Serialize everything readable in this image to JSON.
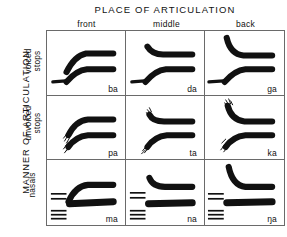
{
  "figure": {
    "type": "schematic-spectrogram-matrix",
    "column_axis_title": "PLACE OF ARTICULATION",
    "row_axis_title": "MANNER OF ARTICULATION",
    "columns": [
      {
        "label": "front"
      },
      {
        "label": "middle"
      },
      {
        "label": "back"
      }
    ],
    "rows": [
      {
        "line1": "voiced",
        "line2": "stops"
      },
      {
        "line1": "unvoiced",
        "line2": "stops"
      },
      {
        "line1": "",
        "line2": "nasals"
      }
    ],
    "cells": [
      [
        {
          "syllable": "ba",
          "place": "front",
          "manner": "voiced stops",
          "features": [
            "voice-bar",
            "f1-rising",
            "f2-rising"
          ]
        },
        {
          "syllable": "da",
          "place": "middle",
          "manner": "voiced stops",
          "features": [
            "voice-bar",
            "f1-rising",
            "f2-falling"
          ]
        },
        {
          "syllable": "ga",
          "place": "back",
          "manner": "voiced stops",
          "features": [
            "voice-bar",
            "f1-rising",
            "f2-falling-steep"
          ]
        }
      ],
      [
        {
          "syllable": "pa",
          "place": "front",
          "manner": "unvoiced stops",
          "features": [
            "aspiration-noise",
            "f1-rising",
            "f2-rising"
          ]
        },
        {
          "syllable": "ta",
          "place": "middle",
          "manner": "unvoiced stops",
          "features": [
            "aspiration-noise",
            "f1-rising",
            "f2-falling"
          ]
        },
        {
          "syllable": "ka",
          "place": "back",
          "manner": "unvoiced stops",
          "features": [
            "aspiration-noise",
            "f1-rising",
            "f2-falling-steep"
          ]
        }
      ],
      [
        {
          "syllable": "ma",
          "place": "front",
          "manner": "nasals",
          "features": [
            "nasal-murmur-bars",
            "f1-rising",
            "f2-rising"
          ]
        },
        {
          "syllable": "na",
          "place": "middle",
          "manner": "nasals",
          "features": [
            "nasal-murmur-bars",
            "f1-flat",
            "f2-falling"
          ]
        },
        {
          "syllable": "ŋa",
          "place": "back",
          "manner": "nasals",
          "features": [
            "nasal-murmur-bars",
            "f1-flat",
            "f2-falling-steep"
          ]
        }
      ]
    ],
    "colors": {
      "ink": "#111111",
      "grid_line": "#6a6a6a",
      "background": "#ffffff"
    }
  }
}
